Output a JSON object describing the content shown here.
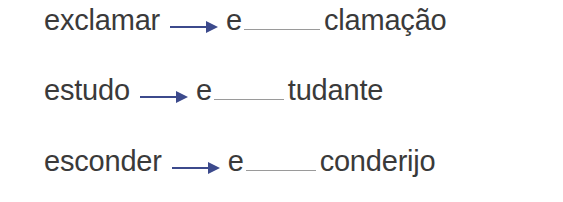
{
  "exercise": {
    "items": [
      {
        "word": "exclamar",
        "prefix": "e",
        "suffix": "clamação",
        "blank_width": 76
      },
      {
        "word": "estudo",
        "prefix": "e",
        "suffix": "tudante",
        "blank_width": 70
      },
      {
        "word": "esconder",
        "prefix": "e",
        "suffix": "conderijo",
        "blank_width": 70
      }
    ]
  },
  "colors": {
    "text": "#3a3a3a",
    "arrow": "#3c4a8c",
    "blank_line": "#9a9a9a"
  }
}
